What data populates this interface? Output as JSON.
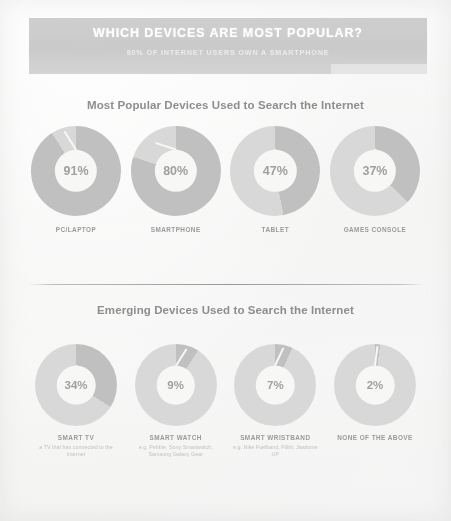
{
  "header": {
    "title": "WHICH DEVICES ARE MOST POPULAR?",
    "subtitle": "80% OF INTERNET USERS OWN A SMARTPHONE",
    "bar_color": "#c6c6c6",
    "title_color": "#ffffff"
  },
  "sections": [
    {
      "heading": "Most Popular Devices Used to Search the Internet",
      "items": [
        {
          "label": "PC/LAPTOP",
          "value": 91,
          "value_text": "91%",
          "sublabel": ""
        },
        {
          "label": "SMARTPHONE",
          "value": 80,
          "value_text": "80%",
          "sublabel": ""
        },
        {
          "label": "TABLET",
          "value": 47,
          "value_text": "47%",
          "sublabel": ""
        },
        {
          "label": "GAMES CONSOLE",
          "value": 37,
          "value_text": "37%",
          "sublabel": ""
        }
      ]
    },
    {
      "heading": "Emerging Devices Used to Search the Internet",
      "items": [
        {
          "label": "SMART TV",
          "value": 34,
          "value_text": "34%",
          "sublabel": "a TV that has connected to the Internet"
        },
        {
          "label": "SMART WATCH",
          "value": 9,
          "value_text": "9%",
          "sublabel": "e.g. Pebble, Sony Smartwatch, Samsung Galaxy Gear"
        },
        {
          "label": "SMART WRISTBAND",
          "value": 7,
          "value_text": "7%",
          "sublabel": "e.g. Nike Fuelband, Fitbit, Jawbone UP"
        },
        {
          "label": "NONE OF THE ABOVE",
          "value": 2,
          "value_text": "2%",
          "sublabel": ""
        }
      ]
    }
  ],
  "style": {
    "donut_track_color": "#d8d8d8",
    "donut_slice_color": "#c0c0c0",
    "page_background": "#f7f7f6"
  },
  "chart_data": {
    "type": "pie",
    "title": "WHICH DEVICES ARE MOST POPULAR?",
    "subtitle": "80% OF INTERNET USERS OWN A SMARTPHONE",
    "unit": "percent",
    "charts": [
      {
        "group": "Most Popular Devices Used to Search the Internet",
        "categories": [
          "PC/LAPTOP",
          "SMARTPHONE",
          "TABLET",
          "GAMES CONSOLE"
        ],
        "values": [
          91,
          80,
          47,
          37
        ]
      },
      {
        "group": "Emerging Devices Used to Search the Internet",
        "categories": [
          "SMART TV",
          "SMART WATCH",
          "SMART WRISTBAND",
          "NONE OF THE ABOVE"
        ],
        "values": [
          34,
          9,
          7,
          2
        ]
      }
    ],
    "xlabel": "",
    "ylabel": "",
    "legend": []
  }
}
